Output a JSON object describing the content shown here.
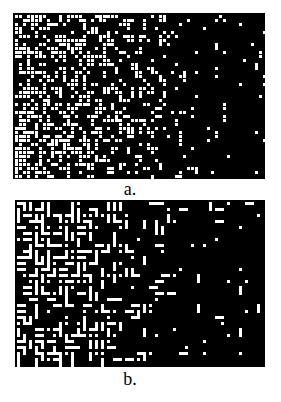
{
  "figure": {
    "background": "#ffffff",
    "panels": [
      {
        "id": "a",
        "label": "a.",
        "description": "Random dot pattern with density gradient: dense on the left, sparse on the right",
        "fg_color": "#ffffff",
        "bg_color": "#000000",
        "width": 252,
        "height": 166,
        "cell": 4,
        "dot": 3,
        "segment_prob": 0.25,
        "density_left": 0.55,
        "density_right": 0.03,
        "seed": 17
      },
      {
        "id": "b",
        "label": "b.",
        "description": "Random dash/segment pattern with density gradient: dense on the left, sparse on the right",
        "fg_color": "#ffffff",
        "bg_color": "#000000",
        "width": 250,
        "height": 167,
        "cell": 6,
        "dot": 3,
        "segment_prob": 0.85,
        "density_left": 0.6,
        "density_right": 0.04,
        "seed": 91
      }
    ]
  }
}
